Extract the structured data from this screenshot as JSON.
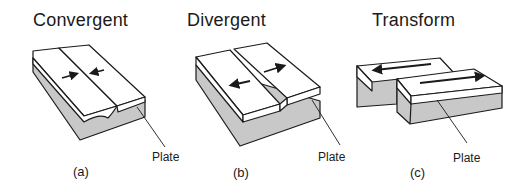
{
  "panels": [
    {
      "title": "Convergent",
      "caption": "(a)",
      "label": "Plate",
      "arrows": "toward each other"
    },
    {
      "title": "Divergent",
      "caption": "(b)",
      "label": "Plate",
      "arrows": "away from each other"
    },
    {
      "title": "Transform",
      "caption": "(c)",
      "label": "Plate",
      "arrows": "sliding past each other"
    }
  ],
  "colors": {
    "outline": "#1a1a1a",
    "slab_top": "#ffffff",
    "slab_side": "#c8c8c8"
  }
}
